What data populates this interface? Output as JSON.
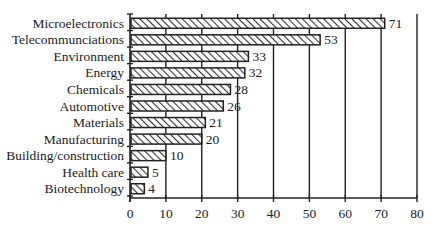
{
  "chart_data": {
    "type": "bar",
    "orientation": "horizontal",
    "title": "",
    "xlabel": "",
    "ylabel": "",
    "categories": [
      "Microelectronics",
      "Telecommunciations",
      "Environment",
      "Energy",
      "Chemicals",
      "Automotive",
      "Materials",
      "Manufacturing",
      "Building/construction",
      "Health care",
      "Biotechnology"
    ],
    "values": [
      71,
      53,
      33,
      32,
      28,
      26,
      21,
      20,
      10,
      5,
      4
    ],
    "xlim": [
      0,
      80
    ],
    "xticks": [
      0,
      10,
      20,
      30,
      40,
      50,
      60,
      70,
      80
    ],
    "grid": "vertical lines at each x tick",
    "legend": null,
    "bar_fill": "diagonal hatch",
    "data_labels": true
  },
  "colors": {
    "ink": "#222222",
    "background": "#ffffff",
    "bar_fill": "#ffffff",
    "hatch": "#333333"
  }
}
